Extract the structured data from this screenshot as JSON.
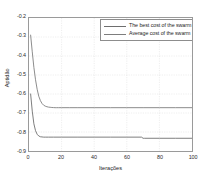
{
  "chart_data": {
    "type": "line",
    "title": "",
    "xlabel": "Iterações",
    "ylabel": "Aptidão",
    "xlim": [
      0,
      100
    ],
    "ylim": [
      -0.9,
      -0.2
    ],
    "xticks": [
      0,
      20,
      40,
      60,
      80,
      100
    ],
    "xtick_labels": [
      "0",
      "20",
      "40",
      "60",
      "80",
      "100"
    ],
    "yticks": [
      -0.2,
      -0.3,
      -0.4,
      -0.5,
      -0.6,
      -0.7,
      -0.8,
      -0.9
    ],
    "ytick_labels": [
      "-0.2",
      "-0.3",
      "-0.4",
      "-0.5",
      "-0.6",
      "-0.7",
      "-0.8",
      "-0.9"
    ],
    "grid": true,
    "legend_position": "upper right",
    "series": [
      {
        "name": "The best cost of the swarm",
        "color": "#6e6e6e",
        "x": [
          1,
          2,
          3,
          4,
          5,
          6,
          7,
          8,
          9,
          10,
          12,
          15,
          20,
          30,
          40,
          50,
          60,
          69,
          70,
          71,
          80,
          90,
          100
        ],
        "y": [
          -0.6,
          -0.69,
          -0.757,
          -0.793,
          -0.812,
          -0.821,
          -0.825,
          -0.826,
          -0.827,
          -0.827,
          -0.827,
          -0.827,
          -0.827,
          -0.827,
          -0.827,
          -0.827,
          -0.827,
          -0.827,
          -0.833,
          -0.833,
          -0.833,
          -0.833,
          -0.833
        ]
      },
      {
        "name": "Average cost of the swarm",
        "color": "#7d7d7d",
        "x": [
          1,
          2,
          3,
          4,
          5,
          6,
          7,
          8,
          9,
          10,
          11,
          12,
          13,
          14,
          15,
          16,
          17,
          18,
          20,
          25,
          30,
          40,
          50,
          60,
          70,
          80,
          90,
          100
        ],
        "y": [
          -0.29,
          -0.378,
          -0.46,
          -0.525,
          -0.575,
          -0.612,
          -0.635,
          -0.65,
          -0.659,
          -0.664,
          -0.667,
          -0.669,
          -0.67,
          -0.671,
          -0.6715,
          -0.672,
          -0.672,
          -0.672,
          -0.672,
          -0.672,
          -0.672,
          -0.672,
          -0.672,
          -0.672,
          -0.672,
          -0.672,
          -0.672,
          -0.672
        ]
      }
    ]
  },
  "legend": {
    "entries": [
      {
        "label": "The best cost of the swarm"
      },
      {
        "label": "Average cost of the swarm"
      }
    ]
  },
  "style": {
    "grid_color": "#dcdcdc",
    "axis_color": "#9a9a9a",
    "background": "#ffffff",
    "text_color": "#1e1e1e"
  }
}
